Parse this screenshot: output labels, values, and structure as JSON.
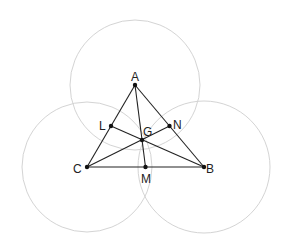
{
  "diagram": {
    "type": "geometry",
    "points": {
      "A": {
        "label": "A",
        "x": 135,
        "y": 85
      },
      "B": {
        "label": "B",
        "x": 204,
        "y": 167
      },
      "C": {
        "label": "C",
        "x": 87,
        "y": 167
      },
      "L": {
        "label": "L",
        "x": 111,
        "y": 126
      },
      "M": {
        "label": "M",
        "x": 145.5,
        "y": 167
      },
      "N": {
        "label": "N",
        "x": 169.5,
        "y": 126
      },
      "G": {
        "label": "G",
        "x": 142,
        "y": 140
      }
    },
    "circles": [
      {
        "center": "A",
        "r": 65
      },
      {
        "center": "C",
        "r": 65
      },
      {
        "center": "B",
        "r": 66
      }
    ],
    "segments": [
      [
        "A",
        "B"
      ],
      [
        "B",
        "C"
      ],
      [
        "C",
        "A"
      ],
      [
        "A",
        "M"
      ],
      [
        "B",
        "L"
      ],
      [
        "C",
        "N"
      ]
    ],
    "colors": {
      "circle": "#d4d4d4",
      "line": "#222222",
      "point": "#111111"
    }
  }
}
